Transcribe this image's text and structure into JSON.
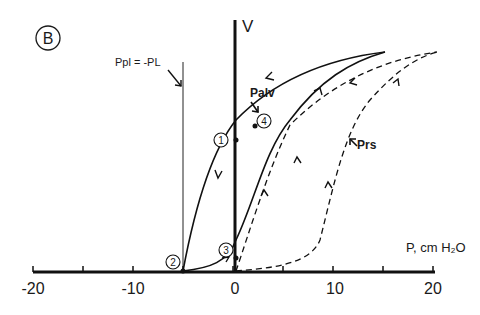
{
  "figure": {
    "panel_label": "B",
    "volume_axis_label": "V",
    "pressure_axis_label": "P, cm H₂O",
    "x_ticks": [
      "-20",
      "-10",
      "0",
      "10",
      "20"
    ],
    "pleural_line_label": "Ppl = -PL",
    "curve_labels": {
      "alveolar": "Palv",
      "respiratory_system": "Prs"
    },
    "points": [
      "1",
      "2",
      "3",
      "4"
    ]
  },
  "chart_data": {
    "type": "line",
    "title": "",
    "xlabel": "P, cm H2O",
    "ylabel": "V",
    "xlim": [
      -20,
      20
    ],
    "x_ticks": [
      -20,
      -15,
      -10,
      -5,
      0,
      5,
      10,
      15,
      20
    ],
    "x_tick_labels": [
      "-20",
      "-10",
      "0",
      "10",
      "20"
    ],
    "vertical_reference_line": {
      "x": -5,
      "label": "Ppl = -PL"
    },
    "series": [
      {
        "name": "Palv loop (solid)",
        "style": "solid",
        "peak_pressure": 15
      },
      {
        "name": "Prs loop (dashed)",
        "style": "dashed",
        "peak_pressure": 20
      }
    ],
    "annotated_points": [
      {
        "label": "1",
        "x": 0
      },
      {
        "label": "2",
        "x": -5
      },
      {
        "label": "3",
        "x": 0
      },
      {
        "label": "4",
        "x": 2
      }
    ]
  }
}
